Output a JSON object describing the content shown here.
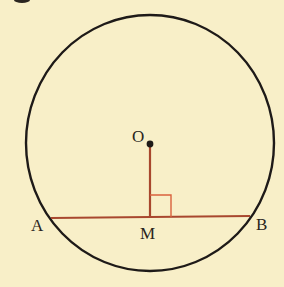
{
  "diagram": {
    "colors": {
      "background": "#f8efc8",
      "circle": "#1e1a18",
      "segment": "#a8472e",
      "right_angle": "#d9623d",
      "point": "#1e1a18"
    },
    "circle": {
      "cx": 150,
      "cy": 143,
      "rx": 124,
      "ry": 128
    },
    "points": {
      "O": {
        "label": "O",
        "x": 150,
        "y": 144
      },
      "A": {
        "label": "A",
        "x": 51,
        "y": 218
      },
      "B": {
        "label": "B",
        "x": 250,
        "y": 216
      },
      "M": {
        "label": "M",
        "x": 150,
        "y": 217
      }
    },
    "segments": [
      {
        "name": "chord-AB",
        "from": "A",
        "to": "B"
      },
      {
        "name": "OM",
        "from": "O",
        "to": "M"
      }
    ],
    "right_angle_marker": {
      "at": "M",
      "size": 21
    }
  }
}
